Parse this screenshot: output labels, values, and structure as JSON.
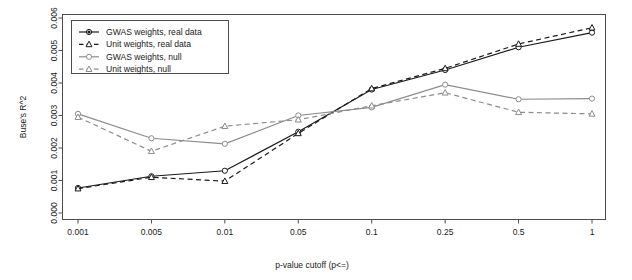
{
  "chart_data": {
    "type": "line",
    "title": "",
    "xlabel": "p-value cutoff (p<=)",
    "ylabel": "Buse's R^2",
    "categories": [
      "0.001",
      "0.005",
      "0.01",
      "0.05",
      "0.1",
      "0.25",
      "0.5",
      "1"
    ],
    "x_tick_labels": [
      "0.001",
      "0.005",
      "0.01",
      "0.05",
      "0.1",
      "0.25",
      "0.5",
      "1"
    ],
    "y_tick_labels": [
      "0.000",
      "0.001",
      "0.002",
      "0.003",
      "0.004",
      "0.005",
      "0.006"
    ],
    "y_tick_values": [
      0.0,
      0.001,
      0.002,
      0.003,
      0.004,
      0.005,
      0.006
    ],
    "ylim": [
      0.0,
      0.006
    ],
    "grid": false,
    "legend_position": "top-left-inside",
    "series": [
      {
        "name": "GWAS weights, real data",
        "color": "#1a1a1a",
        "linestyle": "solid",
        "marker": "circle",
        "values": [
          0.00077,
          0.00113,
          0.0013,
          0.0025,
          0.0038,
          0.0044,
          0.0051,
          0.00555
        ]
      },
      {
        "name": "Unit weights, real data",
        "color": "#1a1a1a",
        "linestyle": "dashed",
        "marker": "triangle",
        "values": [
          0.00075,
          0.0011,
          0.00098,
          0.00245,
          0.00383,
          0.00445,
          0.0052,
          0.0057
        ]
      },
      {
        "name": "GWAS weights, null",
        "color": "#8c8c8c",
        "linestyle": "solid",
        "marker": "circle",
        "values": [
          0.00305,
          0.0023,
          0.00213,
          0.003,
          0.00325,
          0.00395,
          0.0035,
          0.00352
        ]
      },
      {
        "name": "Unit weights, null",
        "color": "#8c8c8c",
        "linestyle": "dashed",
        "marker": "triangle",
        "values": [
          0.00295,
          0.0019,
          0.00267,
          0.00287,
          0.0033,
          0.0037,
          0.0031,
          0.00305
        ]
      }
    ]
  },
  "legend": {
    "entries": [
      "GWAS weights, real data",
      "Unit weights, real data",
      "GWAS weights, null",
      "Unit weights, null"
    ]
  },
  "axes": {
    "x_title": "p-value cutoff (p<=)",
    "y_title": "Buse's R^2"
  }
}
